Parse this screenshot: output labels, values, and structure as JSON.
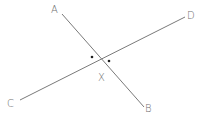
{
  "diagram": {
    "type": "intersecting-lines",
    "colors": {
      "line": "#7a7a7a",
      "label": "#707070",
      "dot": "#202020"
    },
    "lines": [
      {
        "name": "AB",
        "from": "A",
        "to": "B"
      },
      {
        "name": "CD",
        "from": "C",
        "to": "D"
      }
    ],
    "labels": {
      "A": "A",
      "B": "B",
      "C": "C",
      "D": "D",
      "X": "X"
    },
    "intersection": "X",
    "angle_markers": 2
  }
}
